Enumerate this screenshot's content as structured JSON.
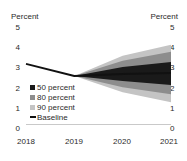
{
  "chart_data": {
    "type": "area",
    "title": "",
    "xlabel": "",
    "ylabel": "Percent",
    "ylabel_right": "Percent",
    "grid": false,
    "legend_position": "inside-left",
    "x": [
      2018,
      2019,
      2020,
      2021
    ],
    "xlim": [
      2018,
      2021
    ],
    "ylim": [
      0,
      5
    ],
    "yticks": [
      0,
      1,
      2,
      3,
      4,
      5
    ],
    "xticks": [
      "2018",
      "2019",
      "2020",
      "2021"
    ],
    "series": [
      {
        "name": "Baseline",
        "values": [
          3.0,
          2.4,
          2.5,
          2.55
        ]
      },
      {
        "name": "50 percent lower",
        "values": [
          null,
          2.4,
          2.15,
          1.95
        ]
      },
      {
        "name": "50 percent upper",
        "values": [
          null,
          2.4,
          2.85,
          3.1
        ]
      },
      {
        "name": "80 percent lower",
        "values": [
          null,
          2.4,
          1.85,
          1.5
        ]
      },
      {
        "name": "80 percent upper",
        "values": [
          null,
          2.4,
          3.15,
          3.6
        ]
      },
      {
        "name": "90 percent lower",
        "values": [
          null,
          2.4,
          1.6,
          1.1
        ]
      },
      {
        "name": "90 percent upper",
        "values": [
          null,
          2.4,
          3.4,
          3.95
        ]
      }
    ],
    "colors": {
      "band_50": "#1a1a1a",
      "band_80": "#8d8d8d",
      "band_90": "#c4c4c4",
      "baseline": "#111111",
      "axis": "#c9c9c9",
      "text": "#2b2b2b"
    }
  },
  "axes": {
    "left_title": "Percent",
    "right_title": "Percent",
    "yticks_left": [
      "5",
      "4",
      "3",
      "2",
      "1",
      "0"
    ],
    "yticks_right": [
      "5",
      "4",
      "3",
      "2",
      "1",
      "0"
    ],
    "xticks": [
      "2018",
      "2019",
      "2020",
      "2021"
    ]
  },
  "legend": {
    "items": [
      {
        "label": "50 percent",
        "marker": "swatch-dark"
      },
      {
        "label": "80 percent",
        "marker": "swatch-medium"
      },
      {
        "label": "90 percent",
        "marker": "swatch-light"
      },
      {
        "label": "Baseline",
        "marker": "line-black"
      }
    ]
  }
}
